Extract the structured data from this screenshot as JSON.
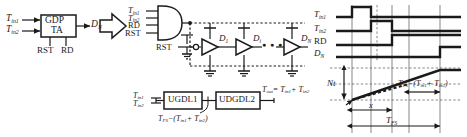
{
  "block_left": {
    "box_label_line1": "GDP",
    "box_label_line2": "TA",
    "input_1": "T",
    "input_1_sub": "in1",
    "input_2": "T",
    "input_2_sub": "in2",
    "output": "D",
    "output_sub": "N",
    "bottom_left": "RST",
    "bottom_right": "RD",
    "transition_arrow": "arrow-right"
  },
  "circuit_middle": {
    "gate_inputs": [
      {
        "name": "T",
        "sub": "in1"
      },
      {
        "name": "T",
        "sub": "in2"
      },
      {
        "name": "RD",
        "sub": ""
      },
      {
        "name": "RST",
        "sub": ""
      }
    ],
    "reset_label": "RST",
    "stage_labels": [
      {
        "name": "D",
        "sub": "1"
      },
      {
        "name": "D",
        "sub": "i"
      },
      {
        "name": "D",
        "sub": "N"
      }
    ],
    "ellipsis": "● ● ●",
    "gate_type": "and-gate",
    "buffer_type": "delay-buffer"
  },
  "block_bottom": {
    "input_1": "T",
    "input_1_sub": "in1",
    "input_2": "T",
    "input_2_sub": "in2",
    "box_1": "UGDL1",
    "box_2": "UDGDL2",
    "mid_label_main": "T",
    "mid_label_sub": "FS",
    "mid_label_rest": "−(T",
    "mid_label_sub2": "in1",
    "mid_label_rest2": "+ T",
    "mid_label_sub3": "in2",
    "mid_label_rest3": ")",
    "out_label_main": "T",
    "out_label_sub": "out",
    "out_label_rest": "= T",
    "out_label_sub2": "in1",
    "out_label_rest2": "+ T",
    "out_label_sub3": "in2"
  },
  "timing": {
    "signals": [
      {
        "name": "T",
        "sub": "in1"
      },
      {
        "name": "T",
        "sub": "in2"
      },
      {
        "name": "RD",
        "sub": ""
      },
      {
        "name": "D",
        "sub": "N"
      }
    ]
  },
  "graph": {
    "y_axis_label": "Nt",
    "ramp_annotation_main": "T",
    "ramp_annotation_sub": "FS",
    "ramp_annotation_rest": "−(T",
    "ramp_annotation_sub2": "in1",
    "ramp_annotation_rest2": "+ T",
    "ramp_annotation_sub3": "in2",
    "ramp_annotation_rest3": ")",
    "measure_x": "x",
    "measure_total_main": "T",
    "measure_total_sub": "FS"
  },
  "colors": {
    "ink": "#1a1a1a",
    "grid": "#555555",
    "background": "#ffffff"
  }
}
